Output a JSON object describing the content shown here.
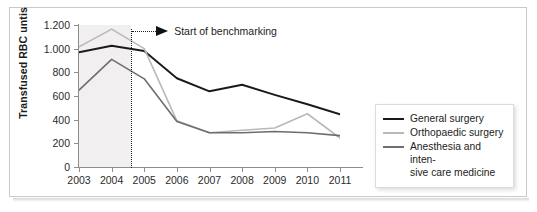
{
  "chart_data": {
    "type": "line",
    "title": "",
    "xlabel": "",
    "ylabel": "Transfused RBC untis",
    "categories": [
      "2003",
      "2004",
      "2005",
      "2006",
      "2007",
      "2008",
      "2009",
      "2010",
      "2011"
    ],
    "ylim": [
      0,
      1200
    ],
    "yticks": [
      0,
      200,
      400,
      600,
      800,
      1000,
      1200
    ],
    "ytick_labels": [
      "0",
      "200",
      "400",
      "600",
      "800",
      "1.000",
      "1.200"
    ],
    "grid": false,
    "legend_position": "right-inside",
    "series": [
      {
        "name": "General surgery",
        "color": "#1a1a1a",
        "width": 1.9,
        "values": [
          970,
          1025,
          980,
          750,
          640,
          695,
          610,
          530,
          445
        ]
      },
      {
        "name": "Orthopaedic surgery",
        "color": "#b9b9b9",
        "width": 1.6,
        "values": [
          1015,
          1165,
          1000,
          390,
          290,
          310,
          330,
          450,
          245
        ]
      },
      {
        "name": "Anesthesia and inten-sive care medicine",
        "color": "#6e6e6e",
        "width": 1.6,
        "values": [
          650,
          910,
          745,
          385,
          290,
          290,
          300,
          290,
          265
        ]
      }
    ],
    "annotations": [
      {
        "name": "benchmark-marker",
        "text": "Start of benchmarking",
        "x_value": 2004.6,
        "style": "dotted-vertical-with-arrow"
      }
    ],
    "shaded_region": {
      "name": "pre-benchmark-band",
      "from": 2003,
      "to": 2004.6,
      "color": "#eceaea"
    }
  },
  "legend": {
    "entries": [
      {
        "label": "General surgery",
        "color": "#1a1a1a"
      },
      {
        "label": "Orthopaedic surgery",
        "color": "#b9b9b9"
      },
      {
        "label": "Anesthesia and inten-",
        "label2": "sive care medicine",
        "color": "#6e6e6e"
      }
    ]
  }
}
